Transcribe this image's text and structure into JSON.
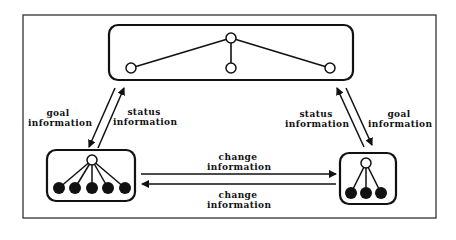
{
  "diagram": {
    "colors": {
      "stroke": "#111111",
      "background": "#ffffff",
      "node_open_fill": "#ffffff",
      "node_filled_fill": "#111111"
    },
    "frame": {
      "label": ""
    },
    "top_unit": {
      "label": "",
      "nodes": [
        {
          "id": "t0",
          "x": 231,
          "y": 38,
          "filled": false
        },
        {
          "id": "t1",
          "x": 131,
          "y": 68,
          "filled": false
        },
        {
          "id": "t2",
          "x": 231,
          "y": 68,
          "filled": false
        },
        {
          "id": "t3",
          "x": 330,
          "y": 68,
          "filled": false
        }
      ],
      "edges": [
        [
          "t0",
          "t1"
        ],
        [
          "t0",
          "t2"
        ],
        [
          "t0",
          "t3"
        ]
      ]
    },
    "left_unit": {
      "nodes": [
        {
          "id": "l0",
          "x": 92,
          "y": 160,
          "filled": false
        },
        {
          "id": "l1",
          "x": 59,
          "y": 188,
          "filled": true
        },
        {
          "id": "l2",
          "x": 75,
          "y": 188,
          "filled": true
        },
        {
          "id": "l3",
          "x": 92,
          "y": 188,
          "filled": true
        },
        {
          "id": "l4",
          "x": 108,
          "y": 188,
          "filled": true
        },
        {
          "id": "l5",
          "x": 125,
          "y": 188,
          "filled": true
        }
      ]
    },
    "right_unit": {
      "nodes": [
        {
          "id": "r0",
          "x": 366,
          "y": 163,
          "filled": false
        },
        {
          "id": "r1",
          "x": 351,
          "y": 193,
          "filled": true
        },
        {
          "id": "r2",
          "x": 366,
          "y": 193,
          "filled": true
        },
        {
          "id": "r3",
          "x": 381,
          "y": 193,
          "filled": true
        }
      ]
    },
    "labels": {
      "left_goal": {
        "line1": "goal",
        "line2": "information"
      },
      "left_status": {
        "line1": "status",
        "line2": "information"
      },
      "right_status": {
        "line1": "status",
        "line2": "information"
      },
      "right_goal": {
        "line1": "goal",
        "line2": "information"
      },
      "change_top": {
        "line1": "change",
        "line2": "information"
      },
      "change_bottom": {
        "line1": "change",
        "line2": "information"
      }
    },
    "arrows": [
      {
        "name": "left-goal-arrow",
        "from": "top_unit",
        "to": "left_unit",
        "label": "goal information"
      },
      {
        "name": "left-status-arrow",
        "from": "left_unit",
        "to": "top_unit",
        "label": "status information"
      },
      {
        "name": "right-status-arrow",
        "from": "right_unit",
        "to": "top_unit",
        "label": "status information"
      },
      {
        "name": "right-goal-arrow",
        "from": "top_unit",
        "to": "right_unit",
        "label": "goal information"
      },
      {
        "name": "change-arrow-left-to-right",
        "from": "left_unit",
        "to": "right_unit",
        "label": "change information"
      },
      {
        "name": "change-arrow-right-to-left",
        "from": "right_unit",
        "to": "left_unit",
        "label": "change information"
      }
    ]
  }
}
